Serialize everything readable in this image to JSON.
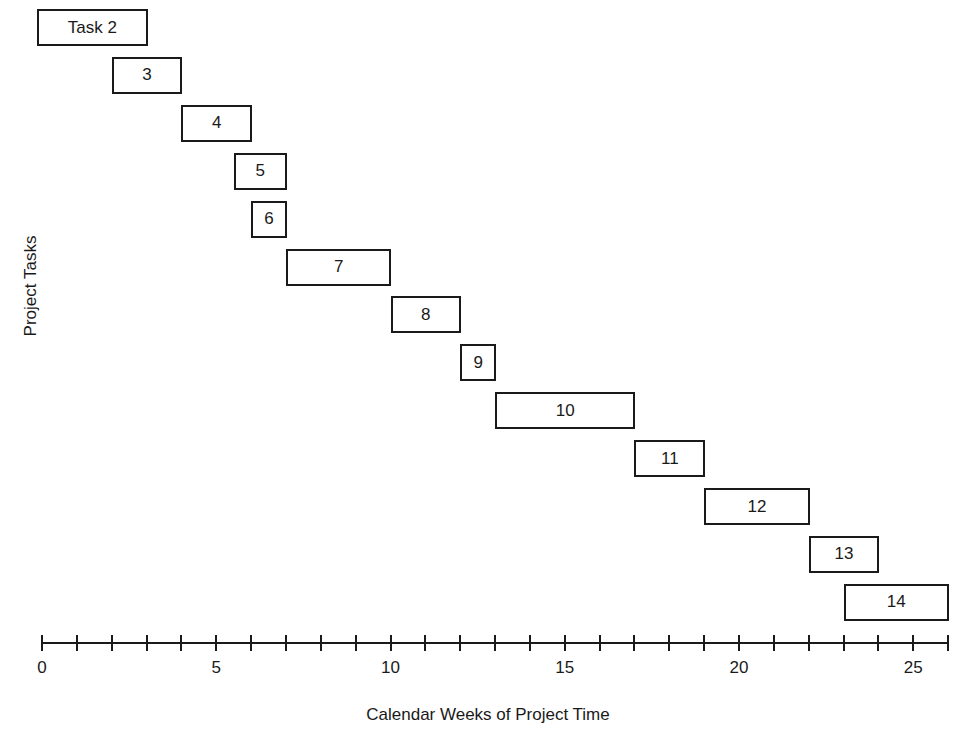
{
  "chart_data": {
    "type": "gantt",
    "title": "",
    "xlabel": "Calendar Weeks of Project Time",
    "ylabel": "Project Tasks",
    "xlim": [
      0,
      26
    ],
    "x_ticks_major": [
      0,
      5,
      10,
      15,
      20,
      25
    ],
    "x_tick_step": 1,
    "grid": false,
    "legend": null,
    "tasks": [
      {
        "label": "Task 2",
        "start": 0,
        "end": 3
      },
      {
        "label": "3",
        "start": 2,
        "end": 4
      },
      {
        "label": "4",
        "start": 4,
        "end": 6
      },
      {
        "label": "5",
        "start": 5.5,
        "end": 7
      },
      {
        "label": "6",
        "start": 6,
        "end": 7
      },
      {
        "label": "7",
        "start": 7,
        "end": 10
      },
      {
        "label": "8",
        "start": 10,
        "end": 12
      },
      {
        "label": "9",
        "start": 12,
        "end": 13
      },
      {
        "label": "10",
        "start": 13,
        "end": 17
      },
      {
        "label": "11",
        "start": 17,
        "end": 19
      },
      {
        "label": "12",
        "start": 19,
        "end": 22
      },
      {
        "label": "13",
        "start": 22,
        "end": 24
      },
      {
        "label": "14",
        "start": 23,
        "end": 26
      }
    ]
  },
  "layout": {
    "x0_px": 42,
    "px_per_week": 34.85,
    "first_row_top": 9,
    "row_step": 47.9,
    "bar_height": 37,
    "axis_y": 642
  }
}
